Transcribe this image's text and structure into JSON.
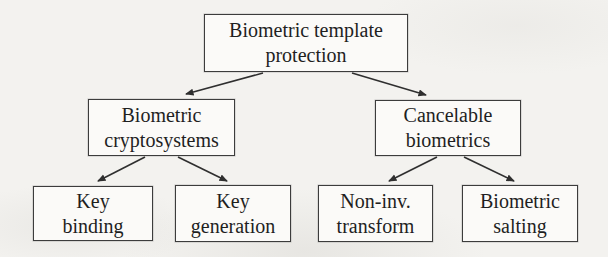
{
  "colors": {
    "paper": "#f3f2ef",
    "box_fill": "#fbfaf8",
    "border": "#3c3c3c",
    "ink": "#1f1f1f",
    "arrow": "#2f2f2f"
  },
  "diagram": {
    "type": "tree",
    "nodes": {
      "root": {
        "label": "Biometric template protection",
        "lines": [
          "Biometric template",
          "protection"
        ]
      },
      "cryptosystems": {
        "label": "Biometric cryptosystems",
        "lines": [
          "Biometric",
          "cryptosystems"
        ]
      },
      "cancelable": {
        "label": "Cancelable biometrics",
        "lines": [
          "Cancelable",
          "biometrics"
        ]
      },
      "key_binding": {
        "label": "Key binding",
        "lines": [
          "Key",
          "binding"
        ]
      },
      "key_generation": {
        "label": "Key generation",
        "lines": [
          "Key",
          "generation"
        ]
      },
      "non_inv_transform": {
        "label": "Non-inv. transform",
        "lines": [
          "Non-inv.",
          "transform"
        ]
      },
      "biometric_salting": {
        "label": "Biometric salting",
        "lines": [
          "Biometric",
          "salting"
        ]
      }
    },
    "edges": [
      {
        "from": "root",
        "to": "cryptosystems"
      },
      {
        "from": "root",
        "to": "cancelable"
      },
      {
        "from": "cryptosystems",
        "to": "key_binding"
      },
      {
        "from": "cryptosystems",
        "to": "key_generation"
      },
      {
        "from": "cancelable",
        "to": "non_inv_transform"
      },
      {
        "from": "cancelable",
        "to": "biometric_salting"
      }
    ]
  }
}
